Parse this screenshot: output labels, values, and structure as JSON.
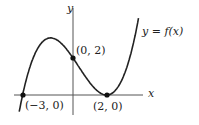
{
  "diagram": {
    "type": "function-graph",
    "function_label": "y = f(x)",
    "axis_labels": {
      "x": "x",
      "y": "y"
    },
    "points": [
      {
        "label": "(−3, 0)",
        "x": -3,
        "y": 0
      },
      {
        "label": "(0, 2)",
        "x": 0,
        "y": 2
      },
      {
        "label": "(2, 0)",
        "x": 2,
        "y": 0
      }
    ],
    "curve": "cubic f(x) = (1/6)(x+3)(x−2)^2",
    "colors": {
      "curve": "#222222",
      "axes": "#444444",
      "points": "#111111"
    }
  }
}
